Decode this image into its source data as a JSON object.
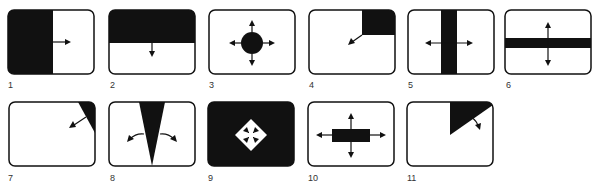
{
  "figure": {
    "panels": [
      {
        "number": "1",
        "pattern": "horizontal-wipe-left-to-right",
        "icon": "arrow-right-icon"
      },
      {
        "number": "2",
        "pattern": "vertical-wipe-top-to-bottom",
        "icon": "arrow-down-icon"
      },
      {
        "number": "3",
        "pattern": "circle-iris-out",
        "icon": "four-way-arrows-icon"
      },
      {
        "number": "4",
        "pattern": "corner-box-wipe-top-right",
        "icon": "arrow-down-left-icon"
      },
      {
        "number": "5",
        "pattern": "vertical-bar-split-horizontal",
        "icon": "left-right-arrows-icon"
      },
      {
        "number": "6",
        "pattern": "horizontal-bar-split-vertical",
        "icon": "up-down-arrows-icon"
      },
      {
        "number": "7",
        "pattern": "diagonal-corner-wipe",
        "icon": "arrow-down-left-icon"
      },
      {
        "number": "8",
        "pattern": "v-wedge-spread",
        "icon": "curved-spread-arrows-icon"
      },
      {
        "number": "9",
        "pattern": "diamond-iris-in",
        "icon": "inward-arrows-icon"
      },
      {
        "number": "10",
        "pattern": "rectangle-box-expand",
        "icon": "four-way-arrows-icon"
      },
      {
        "number": "11",
        "pattern": "clock-sweep-wipe",
        "icon": "arrow-down-right-icon"
      }
    ]
  },
  "colors": {
    "fill": "#111111",
    "background": "#ffffff",
    "stroke": "#111111"
  }
}
